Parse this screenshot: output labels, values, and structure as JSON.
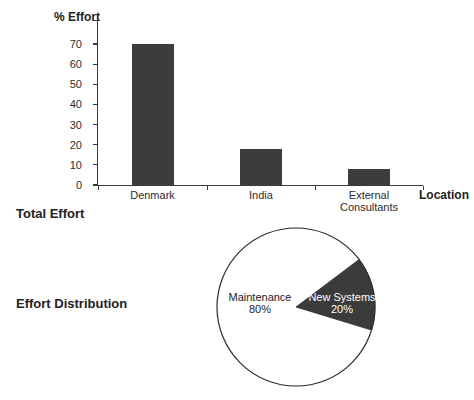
{
  "colors": {
    "background": "#ffffff",
    "ink": "#222222",
    "axis": "#3a3a3a",
    "bar_fill": "#3c3c3c",
    "pie_slice_fill": "#3b3b3b",
    "pie_outline": "#2b2b2b",
    "pie_slice_label_color": "#ffffff"
  },
  "sections": {
    "bar_title": "Total Effort",
    "pie_title": "Effort Distribution"
  },
  "chart_data": [
    {
      "type": "bar",
      "title": "Total Effort",
      "ylabel": "% Effort",
      "xlabel": "Location",
      "categories": [
        "Denmark",
        "India",
        "External Consultants"
      ],
      "values": [
        70,
        18,
        8
      ],
      "ylim": [
        0,
        70
      ],
      "ytick_step": 10,
      "ytick_labels": [
        "0",
        "10",
        "20",
        "30",
        "40",
        "50",
        "60",
        "70"
      ],
      "grid": false,
      "legend": "none",
      "bar_color": "#3c3c3c"
    },
    {
      "type": "pie",
      "title": "Effort Distribution",
      "labels": [
        "Maintenance",
        "New Systems"
      ],
      "values": [
        80,
        20
      ],
      "value_labels": [
        "80%",
        "20%"
      ],
      "slice_colors": [
        "#ffffff",
        "#3b3b3b"
      ],
      "label_text_colors": [
        "#222222",
        "#ffffff"
      ],
      "drawn_slice_angles_deg": [
        -37,
        17
      ],
      "legend": "none"
    }
  ]
}
